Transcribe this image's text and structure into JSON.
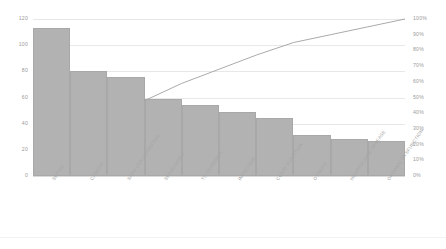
{
  "chart_data": {
    "type": "bar",
    "title": "",
    "subtitle": "",
    "xlabel": "",
    "ylabel": "",
    "y2label": "",
    "grid": true,
    "legend": "none",
    "categories": [
      "SEPSIS",
      "CANCER",
      "SARS COV-2 POSITIVE",
      "SEROLOGIES",
      "TU CEREBRAL",
      "INFECTION",
      "COVID SUSPITION",
      "OTHERS",
      "HEMATOLOGIC DISEASE",
      "ORGANIC DYSFUNCTION"
    ],
    "series": [
      {
        "name": "Frequency",
        "type": "bar",
        "axis": "left",
        "values": [
          113,
          80,
          76,
          59,
          54,
          49,
          44,
          31,
          28,
          27
        ]
      },
      {
        "name": "Cumulative %",
        "type": "line",
        "axis": "right",
        "values": [
          20,
          35,
          48,
          59,
          68,
          77,
          85,
          90,
          95,
          100
        ]
      }
    ],
    "ylim": [
      0,
      120
    ],
    "y2lim": [
      0,
      100
    ],
    "yticks": [
      "0",
      "20",
      "40",
      "60",
      "80",
      "100",
      "120"
    ],
    "ytick_values": [
      0,
      20,
      40,
      60,
      80,
      100,
      120
    ],
    "y2ticks": [
      "0%",
      "10%",
      "20%",
      "30%",
      "40%",
      "50%",
      "60%",
      "70%",
      "80%",
      "90%",
      "100%"
    ],
    "y2tick_values": [
      0,
      10,
      20,
      30,
      40,
      50,
      60,
      70,
      80,
      90,
      100
    ],
    "colors": {
      "bar": "#b2b2b2",
      "bar_border": "#a8a8a8",
      "line": "#a0a0a0",
      "grid": "#e8e8e8",
      "tick_text": "#9b9b9b",
      "category_text": "#a6a6a6",
      "background": "#ffffff"
    }
  }
}
